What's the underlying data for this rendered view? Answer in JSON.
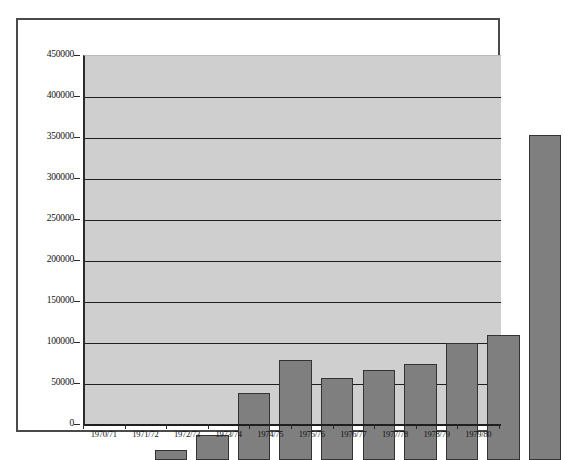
{
  "chart_data": {
    "type": "bar",
    "title": "",
    "xlabel": "",
    "ylabel": "",
    "categories": [
      "1970/71",
      "1971/72",
      "1972/73",
      "1973/74",
      "1974/75",
      "1975/76",
      "1976/77",
      "1977/78",
      "1978/79",
      "1979/80"
    ],
    "values": [
      12000,
      31000,
      82000,
      122000,
      100000,
      110000,
      117000,
      143000,
      153000,
      396000
    ],
    "ylim": [
      0,
      450000
    ],
    "ytick_labels": [
      "450000",
      "400000",
      "350000",
      "300000",
      "250000",
      "200000",
      "150000",
      "100000",
      "50000",
      "0"
    ],
    "ytick_values": [
      450000,
      400000,
      350000,
      300000,
      250000,
      200000,
      150000,
      100000,
      50000,
      0
    ],
    "grid": true,
    "legend": "none",
    "series_color": "#7f7f7f",
    "plot_background": "#cfcfcf",
    "gridline_color": "#1f1f1f",
    "frame_color": "#4a4a4a"
  },
  "caption": {
    "text": ""
  }
}
